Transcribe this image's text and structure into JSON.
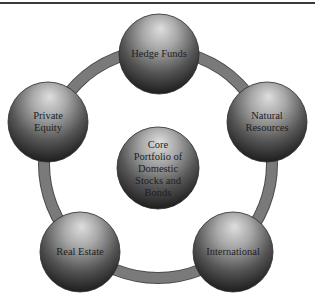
{
  "diagram": {
    "type": "hub-and-ring",
    "ring_color": "#7a7a7a",
    "ring_outline_color": "#4a4a4a",
    "sphere_highlight_color": "#d8d8d8",
    "sphere_shadow_color": "#1a1a1a",
    "center": {
      "label": "Core\nPortfolio of\nDomestic\nStocks and\nBonds"
    },
    "ring_nodes": [
      {
        "id": "hedge-funds",
        "label": "Hedge Funds"
      },
      {
        "id": "natural-resources",
        "label": "Natural\nResources"
      },
      {
        "id": "international",
        "label": "International"
      },
      {
        "id": "real-estate",
        "label": "Real Estate"
      },
      {
        "id": "private-equity",
        "label": "Private\nEquity"
      }
    ]
  }
}
